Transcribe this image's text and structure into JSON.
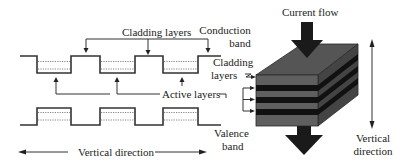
{
  "figure": {
    "labels": {
      "cladding_top": "Cladding layers",
      "conduction_band_line1": "Conduction",
      "conduction_band_line2": "band",
      "cladding_side_line1": "Cladding",
      "cladding_side_line2": "layers",
      "active_layers": "Active layers",
      "valence_band_line1": "Valence",
      "valence_band_line2": "band",
      "vertical_direction_bottom": "Vertical direction",
      "current_flow": "Current flow",
      "vertical_direction_right_line1": "Vertical",
      "vertical_direction_right_line2": "direction"
    },
    "band_diagram": {
      "wells_count": 3,
      "conduction_band": "quantum wells (dips) with two dotted sub-levels each",
      "valence_band": "inverted wells (bumps) with two dotted sub-levels each"
    },
    "block": {
      "active_stripes": 3,
      "colors": {
        "top_face": "#555555",
        "front_face": "#5f5f5f",
        "side_face": "#444444",
        "active_stripe": "#111111",
        "arrow": "#1a1a1a"
      }
    }
  }
}
